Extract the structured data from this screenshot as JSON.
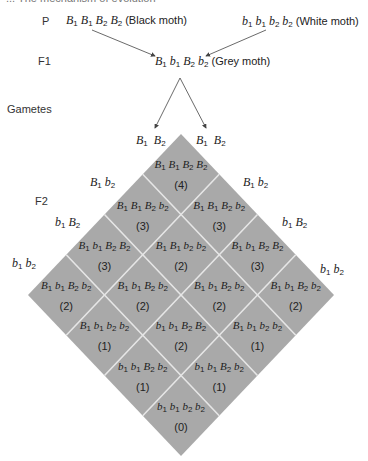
{
  "header": {
    "cropped_text": "... The mechanism of evolution"
  },
  "rows": {
    "p_label": "P",
    "f1_label": "F1",
    "gametes_label": "Gametes",
    "f2_label": "F2"
  },
  "parents": {
    "black": {
      "genotype": [
        [
          "B",
          "1"
        ],
        [
          "B",
          "1"
        ],
        [
          "B",
          "2"
        ],
        [
          "B",
          "2"
        ]
      ],
      "phenotype": "(Black moth)"
    },
    "white": {
      "genotype": [
        [
          "b",
          "1"
        ],
        [
          "b",
          "1"
        ],
        [
          "b",
          "2"
        ],
        [
          "b",
          "2"
        ]
      ],
      "phenotype": "(White moth)"
    }
  },
  "f1": {
    "genotype": [
      [
        "B",
        "1"
      ],
      [
        "b",
        "1"
      ],
      [
        "B",
        "2"
      ],
      [
        "b",
        "2"
      ]
    ],
    "phenotype": "(Grey moth)"
  },
  "gametes": {
    "top_left": [
      [
        "B",
        "1"
      ],
      [
        "B",
        "2"
      ]
    ],
    "top_right": [
      [
        "B",
        "1"
      ],
      [
        "B",
        "2"
      ]
    ],
    "left": [
      [
        [
          "B",
          "1"
        ],
        [
          "b",
          "2"
        ]
      ],
      [
        [
          "b",
          "1"
        ],
        [
          "B",
          "2"
        ]
      ],
      [
        [
          "b",
          "1"
        ],
        [
          "b",
          "2"
        ]
      ]
    ],
    "right": [
      [
        [
          "B",
          "1"
        ],
        [
          "b",
          "2"
        ]
      ],
      [
        [
          "b",
          "1"
        ],
        [
          "B",
          "2"
        ]
      ],
      [
        [
          "b",
          "1"
        ],
        [
          "b",
          "2"
        ]
      ]
    ]
  },
  "colors": {
    "cell_fill": "#a9a9a9",
    "grid_line": "#e6e6e6",
    "arrow": "#444444"
  },
  "grid": {
    "cells": [
      {
        "i": 0,
        "j": 0,
        "genotype": [
          [
            "B",
            "1"
          ],
          [
            "B",
            "1"
          ],
          [
            "B",
            "2"
          ],
          [
            "B",
            "2"
          ]
        ],
        "count": "(4)"
      },
      {
        "i": 1,
        "j": 0,
        "genotype": [
          [
            "B",
            "1"
          ],
          [
            "B",
            "1"
          ],
          [
            "B",
            "2"
          ],
          [
            "b",
            "2"
          ]
        ],
        "count": "(3)"
      },
      {
        "i": 0,
        "j": 1,
        "genotype": [
          [
            "B",
            "1"
          ],
          [
            "B",
            "1"
          ],
          [
            "B",
            "2"
          ],
          [
            "b",
            "2"
          ]
        ],
        "count": "(3)"
      },
      {
        "i": 2,
        "j": 0,
        "genotype": [
          [
            "B",
            "1"
          ],
          [
            "b",
            "1"
          ],
          [
            "B",
            "2"
          ],
          [
            "B",
            "2"
          ]
        ],
        "count": "(3)"
      },
      {
        "i": 1,
        "j": 1,
        "genotype": [
          [
            "B",
            "1"
          ],
          [
            "B",
            "1"
          ],
          [
            "b",
            "2"
          ],
          [
            "b",
            "2"
          ]
        ],
        "count": "(2)"
      },
      {
        "i": 0,
        "j": 2,
        "genotype": [
          [
            "B",
            "1"
          ],
          [
            "b",
            "1"
          ],
          [
            "B",
            "2"
          ],
          [
            "B",
            "2"
          ]
        ],
        "count": "(3)"
      },
      {
        "i": 3,
        "j": 0,
        "genotype": [
          [
            "B",
            "1"
          ],
          [
            "b",
            "1"
          ],
          [
            "B",
            "2"
          ],
          [
            "b",
            "2"
          ]
        ],
        "count": "(2)"
      },
      {
        "i": 2,
        "j": 1,
        "genotype": [
          [
            "B",
            "1"
          ],
          [
            "b",
            "1"
          ],
          [
            "B",
            "2"
          ],
          [
            "b",
            "2"
          ]
        ],
        "count": "(2)"
      },
      {
        "i": 1,
        "j": 2,
        "genotype": [
          [
            "B",
            "1"
          ],
          [
            "b",
            "1"
          ],
          [
            "B",
            "2"
          ],
          [
            "b",
            "2"
          ]
        ],
        "count": "(2)"
      },
      {
        "i": 0,
        "j": 3,
        "genotype": [
          [
            "B",
            "1"
          ],
          [
            "b",
            "1"
          ],
          [
            "B",
            "2"
          ],
          [
            "b",
            "2"
          ]
        ],
        "count": "(2)"
      },
      {
        "i": 3,
        "j": 1,
        "genotype": [
          [
            "B",
            "1"
          ],
          [
            "b",
            "1"
          ],
          [
            "b",
            "2"
          ],
          [
            "b",
            "2"
          ]
        ],
        "count": "(1)"
      },
      {
        "i": 2,
        "j": 2,
        "genotype": [
          [
            "b",
            "1"
          ],
          [
            "b",
            "1"
          ],
          [
            "B",
            "2"
          ],
          [
            "B",
            "2"
          ]
        ],
        "count": "(2)"
      },
      {
        "i": 1,
        "j": 3,
        "genotype": [
          [
            "B",
            "1"
          ],
          [
            "b",
            "1"
          ],
          [
            "b",
            "2"
          ],
          [
            "b",
            "2"
          ]
        ],
        "count": "(1)"
      },
      {
        "i": 3,
        "j": 2,
        "genotype": [
          [
            "b",
            "1"
          ],
          [
            "b",
            "1"
          ],
          [
            "B",
            "2"
          ],
          [
            "b",
            "2"
          ]
        ],
        "count": "(1)"
      },
      {
        "i": 2,
        "j": 3,
        "genotype": [
          [
            "b",
            "1"
          ],
          [
            "b",
            "1"
          ],
          [
            "B",
            "2"
          ],
          [
            "b",
            "2"
          ]
        ],
        "count": "(1)"
      },
      {
        "i": 3,
        "j": 3,
        "genotype": [
          [
            "b",
            "1"
          ],
          [
            "b",
            "1"
          ],
          [
            "b",
            "2"
          ],
          [
            "b",
            "2"
          ]
        ],
        "count": "(0)"
      }
    ]
  }
}
